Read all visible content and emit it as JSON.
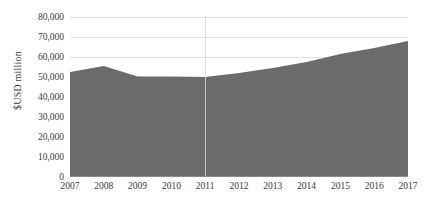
{
  "chart_data": {
    "type": "area",
    "title": "",
    "xlabel": "",
    "ylabel": "$USD million",
    "categories": [
      "2007",
      "2008",
      "2009",
      "2010",
      "2011",
      "2012",
      "2013",
      "2014",
      "2015",
      "2016",
      "2017"
    ],
    "values": [
      52500,
      55500,
      50300,
      50200,
      50000,
      52000,
      54500,
      57500,
      61500,
      64500,
      68000
    ],
    "series": [
      {
        "name": "",
        "values": [
          52500,
          55500,
          50300,
          50200,
          50000,
          52000,
          54500,
          57500,
          61500,
          64500,
          68000
        ]
      }
    ],
    "ylim": [
      0,
      80000
    ],
    "ytick_values": [
      0,
      10000,
      20000,
      30000,
      40000,
      50000,
      60000,
      70000,
      80000
    ],
    "ytick_labels": [
      "0",
      "10,000",
      "20,000",
      "30,000",
      "40,000",
      "50,000",
      "60,000",
      "70,000",
      "80,000"
    ],
    "xtick_labels": [
      "2007",
      "2008",
      "2009",
      "2010",
      "2011",
      "2012",
      "2013",
      "2014",
      "2015",
      "2016",
      "2017"
    ],
    "grid": "horizontal",
    "legend": "none",
    "annotations": [
      {
        "name": "divider-2011",
        "category": "2011"
      }
    ],
    "colors": {
      "area_fill": "#6b6b6b",
      "gridline": "#e2e2e2",
      "axis": "#8a8a8a",
      "text": "#3a3a3a",
      "background": "#ffffff"
    }
  }
}
